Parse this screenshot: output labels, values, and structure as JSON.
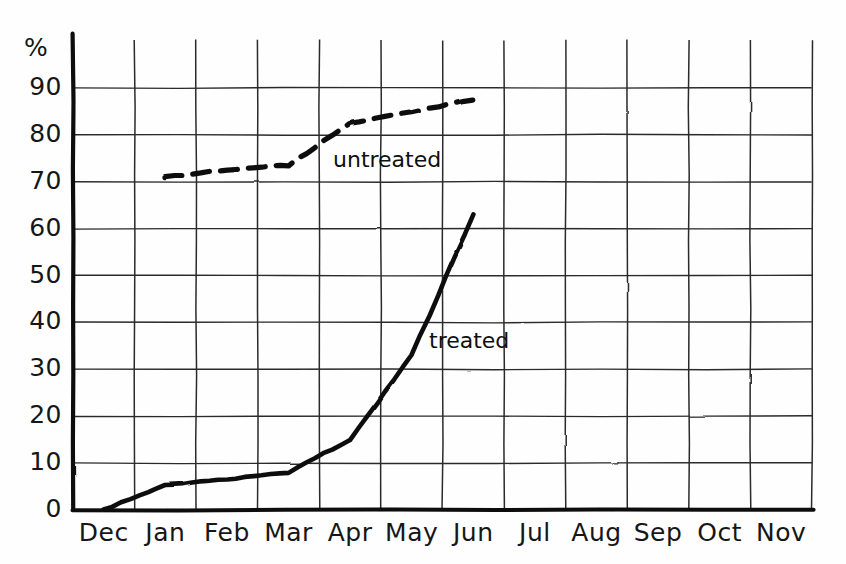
{
  "chart_data": {
    "type": "line",
    "title": "",
    "xlabel": "",
    "ylabel": "%",
    "ylim": [
      0,
      90
    ],
    "xlim": [
      "Dec",
      "Nov"
    ],
    "grid": true,
    "legend_position": "inline-annotation",
    "style": "hand-drawn",
    "categories": [
      "Dec",
      "Jan",
      "Feb",
      "Mar",
      "Apr",
      "May",
      "Jun",
      "Jul",
      "Aug",
      "Sep",
      "Oct",
      "Nov"
    ],
    "y_ticks": [
      "0",
      "10",
      "20",
      "30",
      "40",
      "50",
      "60",
      "70",
      "80",
      "90"
    ],
    "y_tick_values": [
      0,
      10,
      20,
      30,
      40,
      50,
      60,
      70,
      80,
      90
    ],
    "series": [
      {
        "name": "untreated",
        "label": "untreated",
        "linestyle": "dashed",
        "color": "#111111",
        "x": [
          "Jan",
          "Feb",
          "Mar",
          "Apr",
          "May",
          "Jun"
        ],
        "values": [
          71,
          72.5,
          73.5,
          82.5,
          85,
          87.5
        ]
      },
      {
        "name": "treated",
        "label": "treated",
        "linestyle": "solid",
        "color": "#111111",
        "x": [
          "Dec",
          "Jan",
          "Feb",
          "Mar",
          "Apr",
          "May",
          "Jun"
        ],
        "values": [
          0,
          5.3,
          6.5,
          8,
          15,
          33,
          63
        ]
      }
    ],
    "annotations": [
      {
        "text": "untreated",
        "series": "untreated"
      },
      {
        "text": "treated",
        "series": "treated"
      }
    ]
  },
  "axis": {
    "unit_label": "%"
  }
}
